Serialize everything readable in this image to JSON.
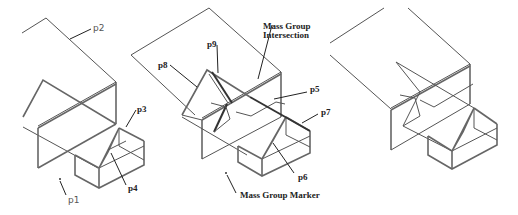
{
  "figure": {
    "panels": [
      {
        "id": "panel-1",
        "labels": {
          "p1": "p1",
          "p2": "p2",
          "p3": "p3",
          "p4": "p4"
        }
      },
      {
        "id": "panel-2",
        "labels": {
          "p5": "p5",
          "p6": "p6",
          "p7": "p7",
          "p8": "p8",
          "p9": "p9",
          "intersection_line1": "Mass Group",
          "intersection_line2": "Intersection",
          "marker": "Mass Group Marker"
        }
      },
      {
        "id": "panel-3",
        "labels": {}
      }
    ]
  }
}
